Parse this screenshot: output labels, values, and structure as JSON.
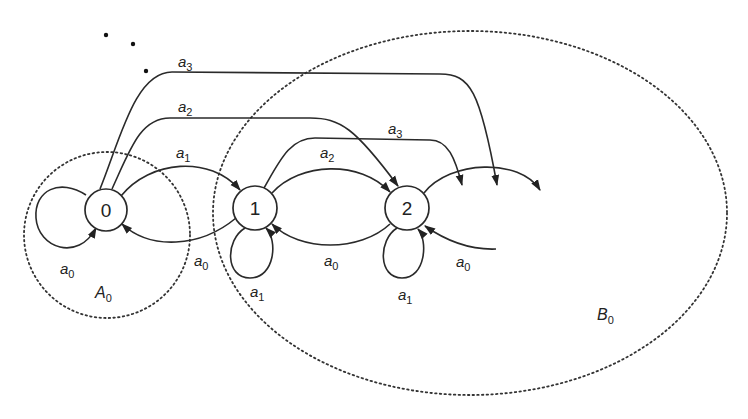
{
  "diagram": {
    "type": "state-transition-diagram",
    "nodes": [
      {
        "id": "0",
        "label": "0",
        "cx": 106,
        "cy": 210,
        "r": 21
      },
      {
        "id": "1",
        "label": "1",
        "cx": 255,
        "cy": 208,
        "r": 22
      },
      {
        "id": "2",
        "label": "2",
        "cx": 407,
        "cy": 208,
        "r": 22
      }
    ],
    "regions": [
      {
        "id": "A0",
        "base": "A",
        "sub": "0",
        "label_x": 95,
        "label_y": 295
      },
      {
        "id": "B0",
        "base": "B",
        "sub": "0",
        "label_x": 598,
        "label_y": 317
      }
    ],
    "edge_labels": [
      {
        "id": "l-0-0-a0",
        "base": "a",
        "sub": "0",
        "x": 60,
        "y": 270
      },
      {
        "id": "l-0-1-a1",
        "base": "a",
        "sub": "1",
        "x": 176,
        "y": 154
      },
      {
        "id": "l-1-0-a0",
        "base": "a",
        "sub": "0",
        "x": 194,
        "y": 262
      },
      {
        "id": "l-0-2-a2",
        "base": "a",
        "sub": "2",
        "x": 178,
        "y": 110
      },
      {
        "id": "l-0-3-a3",
        "base": "a",
        "sub": "3",
        "x": 178,
        "y": 68
      },
      {
        "id": "l-1-1-a1",
        "base": "a",
        "sub": "1",
        "x": 250,
        "y": 300
      },
      {
        "id": "l-1-2-a2",
        "base": "a",
        "sub": "2",
        "x": 320,
        "y": 163
      },
      {
        "id": "l-2-1-a0",
        "base": "a",
        "sub": "0",
        "x": 324,
        "y": 265
      },
      {
        "id": "l-1-3-a3",
        "base": "a",
        "sub": "3",
        "x": 388,
        "y": 133
      },
      {
        "id": "l-2-2-a1",
        "base": "a",
        "sub": "1",
        "x": 398,
        "y": 303
      },
      {
        "id": "l-3-2-a0",
        "base": "a",
        "sub": "0",
        "x": 456,
        "y": 266
      }
    ],
    "ellipsis_dots": [
      {
        "cx": 106,
        "cy": 35
      },
      {
        "cx": 133,
        "cy": 44
      },
      {
        "cx": 146,
        "cy": 71
      }
    ]
  }
}
